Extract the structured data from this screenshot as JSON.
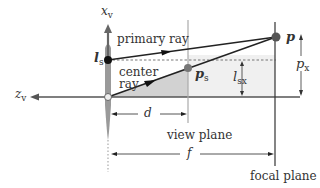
{
  "diagram": {
    "labels": {
      "x_axis": "x",
      "x_axis_sub": "v",
      "z_axis": "z",
      "z_axis_sub": "v",
      "lens_point": "l",
      "lens_point_sub": "s",
      "primary_ray": "primary ray",
      "center_ray_line1": "center",
      "center_ray_line2": "ray",
      "point_P": "p",
      "point_ps": "p",
      "point_ps_sub": "s",
      "l_sx": "l",
      "l_sx_sub": "sx",
      "p_x": "p",
      "p_x_sub": "x",
      "d": "d",
      "f": "f",
      "view_plane": "view plane",
      "focal_plane": "focal plane"
    },
    "colors": {
      "axis": "#555555",
      "lens": "#9a9a9a",
      "shade": "#d4d4d4",
      "light_shade": "#eeeeee",
      "ray": "#222222",
      "point": "#555555"
    }
  }
}
